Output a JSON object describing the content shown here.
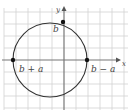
{
  "diagram": {
    "type": "circle-on-coordinate-grid",
    "axes": {
      "x_label": "x",
      "y_label": "y"
    },
    "points": [
      {
        "id": "top",
        "label": "b",
        "position": "y-axis intersection (top)"
      },
      {
        "id": "left",
        "label": "b + a",
        "position": "x-axis intersection (left)"
      },
      {
        "id": "right",
        "label": "b − a",
        "position": "x-axis intersection (right)"
      }
    ],
    "colors": {
      "grid": "#cfcfcf",
      "axes": "#777777",
      "circle": "#333333",
      "points": "#111111",
      "labels": "#444444"
    }
  }
}
